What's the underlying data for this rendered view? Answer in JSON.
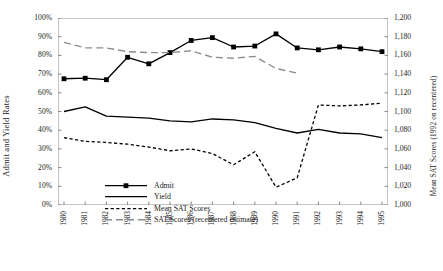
{
  "chart_data": {
    "type": "line",
    "title": "",
    "xlabel": "",
    "categories": [
      "1980",
      "1981",
      "1982",
      "1983",
      "1984",
      "1985",
      "1986",
      "1987",
      "1988",
      "1989",
      "1990",
      "1991",
      "1992",
      "1993",
      "1994",
      "1995"
    ],
    "axes": {
      "left": {
        "label": "Admit and Yield Rates",
        "ticks": [
          "0%",
          "10%",
          "20%",
          "30%",
          "40%",
          "50%",
          "60%",
          "70%",
          "80%",
          "90%",
          "100%"
        ],
        "min": 0,
        "max": 100,
        "step": 10,
        "unit": "%"
      },
      "right": {
        "label": "Mean SAT Scores (1992 on recentered)",
        "ticks": [
          "1,000",
          "1,020",
          "1,040",
          "1,060",
          "1,080",
          "1,100",
          "1,120",
          "1,140",
          "1,160",
          "1,180",
          "1,200"
        ],
        "min": 1000,
        "max": 1200,
        "step": 20
      }
    },
    "grid": false,
    "legend_position": "inside-lower-left",
    "series": [
      {
        "name": "Admit",
        "axis": "left",
        "style": "solid-marker",
        "color": "#000000",
        "marker": "square",
        "values": [
          67.5,
          67.8,
          67.0,
          79.0,
          75.5,
          81.5,
          88.0,
          89.5,
          84.5,
          85.0,
          91.5,
          84.0,
          83.0,
          84.5,
          83.5,
          82.0
        ]
      },
      {
        "name": "Yield",
        "axis": "left",
        "style": "solid",
        "color": "#000000",
        "marker": "none",
        "values": [
          50.0,
          52.5,
          47.5,
          47.0,
          46.5,
          45.0,
          44.5,
          46.0,
          45.5,
          44.0,
          41.0,
          38.5,
          40.5,
          38.5,
          38.0,
          36.0
        ]
      },
      {
        "name": "Mean SAT Scores",
        "axis": "right",
        "style": "dotted",
        "color": "#000000",
        "marker": "none",
        "values": [
          1072,
          1068,
          1067,
          1065,
          1062,
          1058,
          1060,
          1055,
          1043,
          1057,
          1019,
          1029,
          1107,
          1106,
          1107,
          1109
        ]
      },
      {
        "name": "SAT Scores (recentered estimate)",
        "axis": "right",
        "style": "dashed",
        "color": "#8c8c8c",
        "marker": "none",
        "values": [
          1174,
          1168,
          1168,
          1164,
          1163,
          1163,
          1165,
          1158,
          1157,
          1159,
          1146,
          1141,
          null,
          null,
          null,
          null
        ]
      }
    ]
  },
  "legend": {
    "items": [
      {
        "label": "Admit"
      },
      {
        "label": "Yield"
      },
      {
        "label": "Mean SAT Scores"
      },
      {
        "label": "SAT Scores (recentered estimate)"
      }
    ]
  },
  "colors": {
    "axis": "#8a8a8a",
    "solid": "#000000",
    "dashed_gray": "#8c8c8c",
    "text": "#1a1a1a",
    "background": "#ffffff"
  }
}
